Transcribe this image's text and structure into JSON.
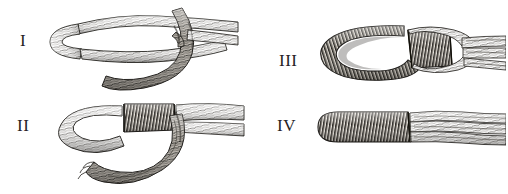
{
  "plate": {
    "title": "Rope eye-splice and whipping stages",
    "background_color": "#ffffff",
    "ink_color": "#26231f",
    "width": 508,
    "height": 194,
    "style": "engraving"
  },
  "figures": [
    {
      "id": "I",
      "label": "I",
      "name": "rope-bight-crossed-over-standing-part",
      "description": "Doubled rope laid in a long bight, the working end crossed over and under the standing part forming an open loop."
    },
    {
      "id": "II",
      "label": "II",
      "name": "rope-loop-with-seizing-whipping",
      "description": "Loop drawn up small and closed with a tight cross-hatched seizing; the tail hangs down and to the right."
    },
    {
      "id": "III",
      "label": "III",
      "name": "served-eye-with-whipped-collar",
      "description": "The eye fully served with fine marline turns, a whipped collar at the throat, and the rope end frayed open at right."
    },
    {
      "id": "IV",
      "label": "IV",
      "name": "finished-whipped-rope-end",
      "description": "Finished rope end: solid whipping over the tapered tip with the laid strands running out to the right."
    }
  ]
}
